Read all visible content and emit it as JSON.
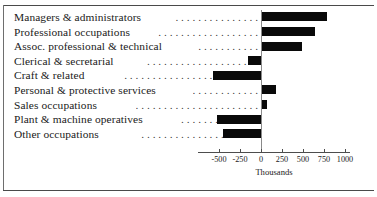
{
  "chart_data": {
    "type": "bar",
    "orientation": "horizontal",
    "title": "",
    "xlabel": "Thousands",
    "ylabel": "",
    "grid": false,
    "legend": "none",
    "xlim": [
      -625,
      1063
    ],
    "xticks": [
      -500,
      -250,
      0,
      250,
      500,
      750,
      1000
    ],
    "xtick_labels": [
      "-500",
      "-250",
      "0",
      "250",
      "500",
      "750",
      "1000"
    ],
    "categories": [
      "Managers & administrators",
      "Professional occupations",
      "Assoc. professional & technical",
      "Clerical & secretarial",
      "Craft & related",
      "Personal & protective services",
      "Sales occupations",
      "Plant & machine operatives",
      "Other occupations"
    ],
    "values": [
      790,
      640,
      490,
      -150,
      -570,
      180,
      75,
      -520,
      -450
    ],
    "bar_color": "#090909",
    "zero_line_color": "#8a8a8a"
  },
  "axis": {
    "title": "Thousands",
    "ticks": [
      {
        "label": "-500",
        "value": -500
      },
      {
        "label": "-250",
        "value": -250
      },
      {
        "label": "0",
        "value": 0
      },
      {
        "label": "250",
        "value": 250
      },
      {
        "label": "500",
        "value": 500
      },
      {
        "label": "750",
        "value": 750
      },
      {
        "label": "1000",
        "value": 1000
      }
    ]
  },
  "rows": [
    {
      "label": "Managers & administrators",
      "leader": ". . . . . . . . . . . . . . .",
      "value": 790
    },
    {
      "label": "Professional occupations",
      "leader": ". . . . . . . . . . . . . . . . . .",
      "value": 640
    },
    {
      "label": "Assoc. professional & technical",
      "leader": ". . . . . . . . . . .",
      "value": 490
    },
    {
      "label": "Clerical & secretarial",
      "leader": ". . . . . . . . . . . . . . . . . . . .",
      "value": -150
    },
    {
      "label": "Craft & related",
      "leader": ". . . . . . . . . . . . . . . . . . . . . . . .",
      "value": -570
    },
    {
      "label": "Personal & protective services",
      "leader": ". . . . . . . . . . . .",
      "value": 180
    },
    {
      "label": "Sales occupations",
      "leader": ". . . . . . . . . . . . . . . . . . . . . .",
      "value": 75
    },
    {
      "label": "Plant & machine operatives",
      "leader": ". . . . . . . . . . . . . .",
      "value": -520
    },
    {
      "label": "Other occupations",
      "leader": ". . . . . . . . . . . . . . . . . . . . .",
      "value": -450
    }
  ]
}
